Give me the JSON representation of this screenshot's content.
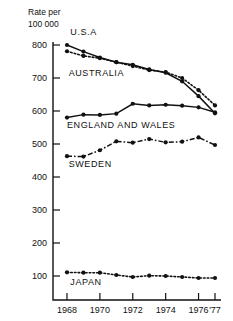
{
  "chart_data": {
    "type": "line",
    "title": "Rate per 100 000",
    "title_line1": "Rate per",
    "title_line2": "100 000",
    "xlabel": "",
    "ylabel": "Rate per 100 000",
    "ylim": [
      0,
      800
    ],
    "xlim": [
      1967.5,
      1977.2
    ],
    "yticks": [
      100,
      200,
      300,
      400,
      500,
      600,
      700,
      800
    ],
    "ytick_labels": [
      "100",
      "200",
      "300",
      "400",
      "500",
      "600",
      "700",
      "800"
    ],
    "xticks": [
      1968,
      1970,
      1972,
      1974,
      1976,
      1977
    ],
    "xtick_labels": [
      "1968",
      "1970",
      "1972",
      "1974",
      "1976",
      "'77"
    ],
    "grid": false,
    "legend_position": "inline-annotations",
    "x": [
      1968,
      1969,
      1970,
      1971,
      1972,
      1973,
      1974,
      1975,
      1976,
      1977
    ],
    "series": [
      {
        "name": "U.S.A",
        "label": "U.S.A",
        "style": "solid",
        "color": "#111111",
        "values": [
          800,
          780,
          762,
          748,
          740,
          726,
          716,
          690,
          645,
          593
        ]
      },
      {
        "name": "AUSTRALIA",
        "label": "AUSTRALIA",
        "style": "dotted",
        "color": "#111111",
        "values": [
          781,
          767,
          760,
          748,
          736,
          724,
          718,
          700,
          663,
          617
        ]
      },
      {
        "name": "ENGLAND AND WALES",
        "label": "ENGLAND AND WALES",
        "style": "solid",
        "color": "#111111",
        "values": [
          580,
          589,
          588,
          592,
          622,
          617,
          619,
          616,
          611,
          596
        ]
      },
      {
        "name": "SWEDEN",
        "label": "SWEDEN",
        "style": "dashdot",
        "color": "#111111",
        "values": [
          463,
          462,
          481,
          508,
          504,
          515,
          505,
          507,
          520,
          497
        ]
      },
      {
        "name": "JAPAN",
        "label": "JAPAN",
        "style": "dotted",
        "color": "#111111",
        "values": [
          111,
          110,
          110,
          103,
          97,
          101,
          100,
          97,
          94,
          94
        ]
      }
    ],
    "annotations": [
      {
        "text": "U.S.A",
        "x": 1968.2,
        "y": 830
      },
      {
        "text": "AUSTRALIA",
        "x": 1968.1,
        "y": 706
      },
      {
        "text": "ENGLAND AND WALES",
        "x": 1968.0,
        "y": 548
      },
      {
        "text": "SWEDEN",
        "x": 1968.1,
        "y": 430
      },
      {
        "text": "JAPAN",
        "x": 1968.2,
        "y": 72
      }
    ]
  }
}
